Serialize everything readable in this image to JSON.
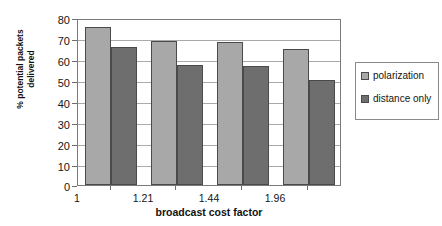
{
  "chart_data": {
    "type": "bar",
    "title": "",
    "subtitle": "",
    "xlabel": "broadcast cost factor",
    "ylabel_lines": [
      "% potential packets",
      "delivered"
    ],
    "ylabel": "% potential packets delivered",
    "categories": [
      "1",
      "1.21",
      "1.44",
      "1.96"
    ],
    "series": [
      {
        "name": "polarization",
        "color": "#a8a8a8",
        "values": [
          75.5,
          69,
          68.5,
          65
        ]
      },
      {
        "name": "distance only",
        "color": "#6e6e6e",
        "values": [
          66,
          57.5,
          57,
          50.5
        ]
      }
    ],
    "ylim": [
      0,
      80
    ],
    "ytick_values": [
      0,
      10,
      20,
      30,
      40,
      50,
      60,
      70,
      80
    ],
    "ytick_labels": [
      "0",
      "10",
      "20",
      "30",
      "40",
      "50",
      "60",
      "70",
      "80"
    ],
    "grid": true,
    "grid_axis": "y",
    "legend_position": "right",
    "legend_entries": [
      "polarization",
      "distance only"
    ],
    "frame_color": "#7a7a7a",
    "grid_color": "#aaaaaa",
    "bar_edge_color": "#4a4a4a",
    "background": "#ffffff"
  }
}
